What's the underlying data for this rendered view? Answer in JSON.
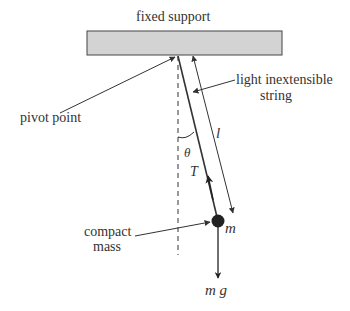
{
  "diagram": {
    "type": "simple pendulum",
    "labels": {
      "support": "fixed support",
      "pivot": "pivot point",
      "string_line1": "light inextensible",
      "string_line2": "string",
      "mass_line1": "compact",
      "mass_line2": "mass",
      "length": "l",
      "angle": "θ",
      "tension": "T",
      "mass_symbol": "m",
      "weight": "m g"
    },
    "colors": {
      "support_fill": "#d3d3d3",
      "line": "#333333",
      "mass": "#222222"
    }
  }
}
